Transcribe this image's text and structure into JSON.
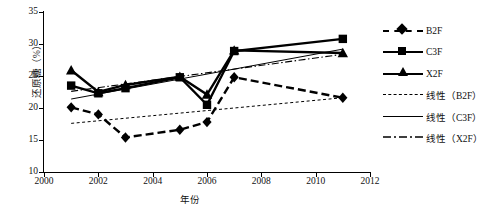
{
  "chart_data": {
    "type": "line",
    "title": "",
    "xlabel": "年份",
    "ylabel": "还原糖（%）",
    "xlim": [
      2000,
      2012
    ],
    "ylim": [
      10,
      35
    ],
    "xticks": [
      "2000",
      "2002",
      "2004",
      "2006",
      "2008",
      "2010",
      "2012"
    ],
    "yticks": [
      "10",
      "15",
      "20",
      "25",
      "30",
      "35"
    ],
    "grid": false,
    "legend_position": "right",
    "x": [
      2001,
      2002,
      2003,
      2005,
      2006,
      2007,
      2011
    ],
    "series": [
      {
        "name": "B2F",
        "marker": "diamond",
        "style": "dashed-thick",
        "values": [
          20.1,
          19.0,
          15.4,
          16.6,
          17.8,
          24.8,
          21.6
        ]
      },
      {
        "name": "C3F",
        "marker": "square",
        "style": "solid-thick",
        "values": [
          23.5,
          22.3,
          23.1,
          24.8,
          20.5,
          28.9,
          30.8
        ]
      },
      {
        "name": "X2F",
        "marker": "triangle",
        "style": "solid-thick",
        "values": [
          25.9,
          22.5,
          23.6,
          24.9,
          22.1,
          29.0,
          28.6
        ]
      }
    ],
    "trendlines": [
      {
        "name": "线性（B2F）",
        "style": "dotted-thin",
        "x": [
          2001,
          2011
        ],
        "values": [
          17.6,
          21.6
        ]
      },
      {
        "name": "线性（C3F）",
        "style": "solid-thin",
        "x": [
          2001,
          2011
        ],
        "values": [
          21.4,
          29.2
        ]
      },
      {
        "name": "线性（X2F）",
        "style": "dashdot-thin",
        "x": [
          2001,
          2011
        ],
        "values": [
          22.6,
          28.4
        ]
      }
    ]
  },
  "legend": {
    "items": [
      {
        "label": "B2F",
        "sample": "dashed-thick-diamond"
      },
      {
        "label": "C3F",
        "sample": "solid-thick-square"
      },
      {
        "label": "X2F",
        "sample": "solid-thick-triangle"
      },
      {
        "label": "线性（B2F）",
        "sample": "dotted-thin"
      },
      {
        "label": "线性（C3F）",
        "sample": "solid-thin"
      },
      {
        "label": "线性（X2F）",
        "sample": "dashdot-thin"
      }
    ]
  },
  "axes": {
    "y_title": "还原糖（%）",
    "x_title": "年份",
    "y_tick_labels": [
      "35",
      "30",
      "25",
      "20",
      "15",
      "10"
    ],
    "x_tick_labels": [
      "2000",
      "2002",
      "2004",
      "2006",
      "2008",
      "2010",
      "2012"
    ]
  },
  "colors": {
    "ink": "#000000",
    "background": "#ffffff"
  }
}
